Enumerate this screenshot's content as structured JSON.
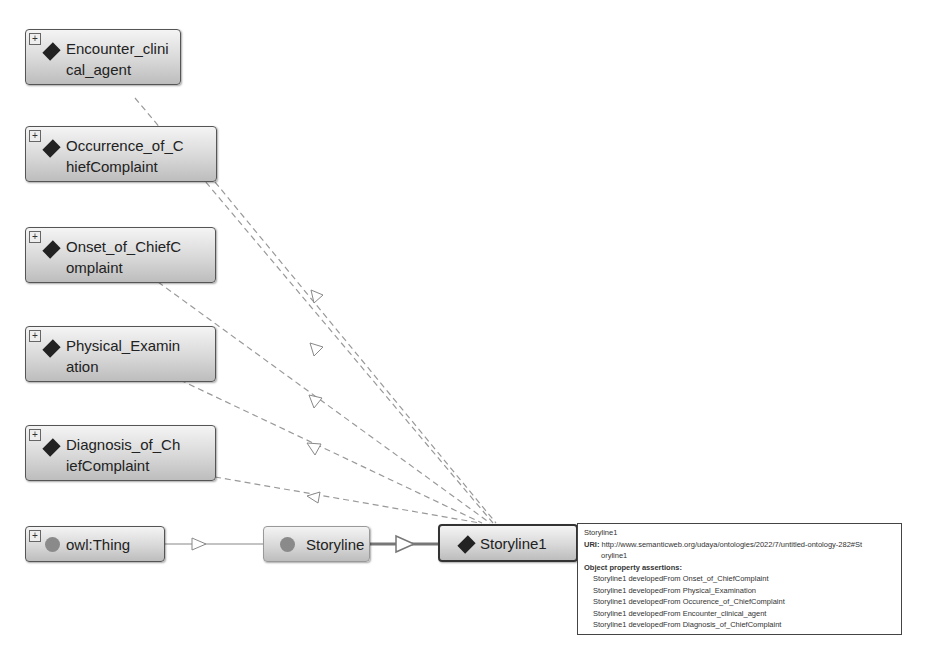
{
  "nodes": {
    "encounter": {
      "label": "Encounter_clinical_agent",
      "line1": "Encounter_clini",
      "line2": "cal_agent",
      "kind": "individual"
    },
    "occurrence": {
      "label": "Occurrence_of_ChiefComplaint",
      "line1": "Occurrence_of_C",
      "line2": "hiefComplaint",
      "kind": "individual"
    },
    "onset": {
      "label": "Onset_of_ChiefComplaint",
      "line1": "Onset_of_ChiefC",
      "line2": "omplaint",
      "kind": "individual"
    },
    "physical": {
      "label": "Physical_Examination",
      "line1": "Physical_Examin",
      "line2": "ation",
      "kind": "individual"
    },
    "diagnosis": {
      "label": "Diagnosis_of_ChiefComplaint",
      "line1": "Diagnosis_of_Ch",
      "line2": "iefComplaint",
      "kind": "individual"
    },
    "thing": {
      "label": "owl:Thing",
      "kind": "class"
    },
    "storyline": {
      "label": "Storyline",
      "kind": "class"
    },
    "storyline1": {
      "label": "Storyline1",
      "kind": "individual"
    }
  },
  "icons": {
    "expand": "+",
    "individual": "diamond-icon",
    "class": "circle-icon"
  },
  "tooltip": {
    "title": "Storyline1",
    "uri_label": "URI:",
    "uri_line1": "http://www.semanticweb.org/udaya/ontologies/2022/7/untitled-ontology-282#St",
    "uri_line2": "oryline1",
    "section": "Object property assertions:",
    "assertions": [
      "Storyline1 developedFrom Onset_of_ChiefComplaint",
      "Storyline1 developedFrom Physical_Examination",
      "Storyline1 developedFrom Occurence_of_ChiefComplaint",
      "Storyline1 developedFrom Encounter_clinical_agent",
      "Storyline1 developedFrom Diagnosis_of_ChiefComplaint"
    ]
  }
}
